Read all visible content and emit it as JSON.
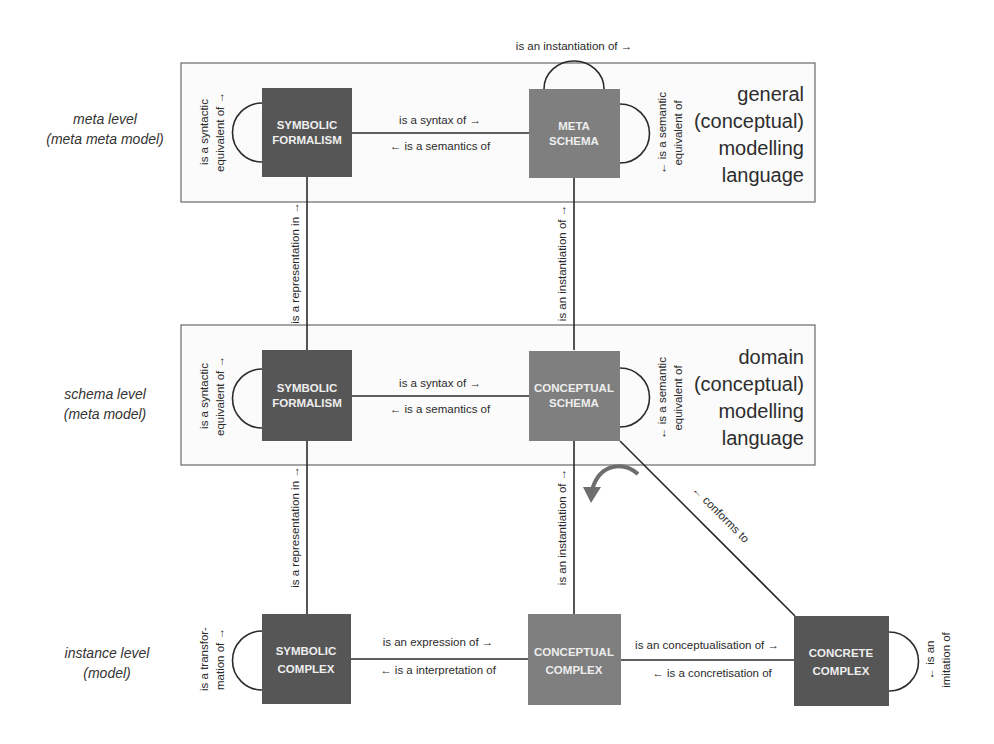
{
  "levels": [
    {
      "line1": "meta level",
      "line2": "(meta meta model)"
    },
    {
      "line1": "schema level",
      "line2": "(meta model)"
    },
    {
      "line1": "instance level",
      "line2": "(model)"
    }
  ],
  "languages": {
    "general": [
      "general",
      "(conceptual)",
      "modelling",
      "language"
    ],
    "domain": [
      "domain",
      "(conceptual)",
      "modelling",
      "language"
    ]
  },
  "boxes": {
    "meta_symbolic": [
      "SYMBOLIC",
      "FORMALISM"
    ],
    "meta_schema": [
      "META",
      "SCHEMA"
    ],
    "schema_symbolic": [
      "SYMBOLIC",
      "FORMALISM"
    ],
    "conceptual_schema": [
      "CONCEPTUAL",
      "SCHEMA"
    ],
    "symbolic_complex": [
      "SYMBOLIC",
      "COMPLEX"
    ],
    "conceptual_complex": [
      "CONCEPTUAL",
      "COMPLEX"
    ],
    "concrete_complex": [
      "CONCRETE",
      "COMPLEX"
    ]
  },
  "box_colors": {
    "dark": "#565656",
    "medium": "#7f7f7f"
  },
  "relations": {
    "meta_instantiation_loop": "is an instantiation of →",
    "meta_syntax_of": "is a syntax of →",
    "meta_semantics_of": "← is a semantics of",
    "meta_syntactic_equiv": [
      "is a syntactic",
      "equivalent of →"
    ],
    "meta_semantic_equiv": [
      "← is a semantic",
      "equivalent of"
    ],
    "schema_syntax_of": "is a syntax of →",
    "schema_semantics_of": "← is a semantics of",
    "schema_syntactic_equiv": [
      "is a syntactic",
      "equivalent of →"
    ],
    "schema_semantic_equiv": [
      "← is a semantic",
      "equivalent of"
    ],
    "representation_upper": "is a representation in →",
    "representation_lower": "is a representation in →",
    "instantiation_upper": "is an instantiation of →",
    "instantiation_lower": "is an instantiation of →",
    "transformation": [
      "is a transfor-",
      "mation of →"
    ],
    "expression_of": "is an expression of →",
    "interpretation_of": "← is a interpretation of",
    "conceptualisation_of": "is an conceptualisation of →",
    "concretisation_of": "← is a concretisation of",
    "imitation": [
      "← is an",
      "imitation of"
    ],
    "conforms_to": "← conforms to"
  }
}
